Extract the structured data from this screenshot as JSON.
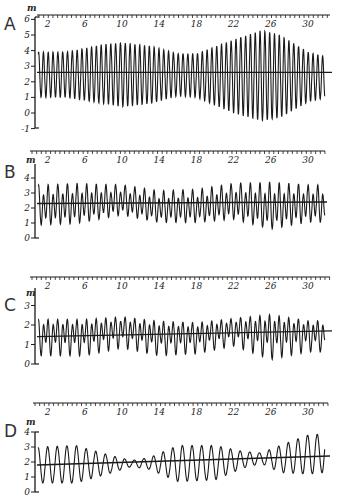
{
  "figure": {
    "unit": "m"
  },
  "chart_data": [
    {
      "type": "line",
      "panel": "A",
      "ylabel": "m",
      "ylim": [
        -1,
        6
      ],
      "yticks": [
        6,
        5,
        4,
        3,
        2,
        1,
        0,
        -1
      ],
      "xlim": [
        1,
        32
      ],
      "xticks": [
        2,
        6,
        10,
        14,
        18,
        22,
        26,
        30
      ],
      "grid": false,
      "mean_level": [
        2.6,
        2.6
      ],
      "tide_type": "semidiurnal",
      "envelope": [
        {
          "day": 1,
          "high": 3.9,
          "low": 1.0
        },
        {
          "day": 4,
          "high": 3.9,
          "low": 1.0
        },
        {
          "day": 8,
          "high": 4.4,
          "low": 0.6
        },
        {
          "day": 10,
          "high": 4.5,
          "low": 0.4
        },
        {
          "day": 13,
          "high": 4.3,
          "low": 0.6
        },
        {
          "day": 16,
          "high": 3.8,
          "low": 1.1
        },
        {
          "day": 18,
          "high": 3.8,
          "low": 1.0
        },
        {
          "day": 22,
          "high": 4.7,
          "low": 0.0
        },
        {
          "day": 25,
          "high": 5.3,
          "low": -0.5
        },
        {
          "day": 27,
          "high": 5.0,
          "low": -0.3
        },
        {
          "day": 30,
          "high": 3.9,
          "low": 0.7
        },
        {
          "day": 32,
          "high": 3.6,
          "low": 1.0
        }
      ]
    },
    {
      "type": "line",
      "panel": "B",
      "ylabel": "m",
      "ylim": [
        0,
        4
      ],
      "yticks": [
        4,
        3,
        2,
        1,
        0
      ],
      "xlim": [
        1,
        32
      ],
      "xticks": [
        2,
        6,
        10,
        14,
        18,
        22,
        26,
        30
      ],
      "grid": false,
      "mean_level": [
        2.3,
        2.4
      ],
      "tide_type": "mixed, mainly semidiurnal",
      "envelope": [
        {
          "day": 1,
          "high": 3.6,
          "low": 0.7
        },
        {
          "day": 5,
          "high": 3.7,
          "low": 0.8
        },
        {
          "day": 10,
          "high": 3.6,
          "low": 1.4
        },
        {
          "day": 14,
          "high": 3.2,
          "low": 0.9
        },
        {
          "day": 18,
          "high": 3.3,
          "low": 0.9
        },
        {
          "day": 22,
          "high": 3.7,
          "low": 1.1
        },
        {
          "day": 26,
          "high": 3.8,
          "low": 0.4
        },
        {
          "day": 30,
          "high": 3.6,
          "low": 0.9
        }
      ]
    },
    {
      "type": "line",
      "panel": "C",
      "ylabel": "m",
      "ylim": [
        0,
        3
      ],
      "yticks": [
        3,
        2,
        1,
        0
      ],
      "xlim": [
        1,
        32
      ],
      "xticks": [
        2,
        6,
        10,
        14,
        18,
        22,
        26,
        30
      ],
      "grid": false,
      "mean_level": [
        1.4,
        1.7
      ],
      "tide_type": "mixed",
      "envelope": [
        {
          "day": 1,
          "high": 2.5,
          "low": 0.4
        },
        {
          "day": 6,
          "high": 2.5,
          "low": 0.4
        },
        {
          "day": 10,
          "high": 2.6,
          "low": 0.8
        },
        {
          "day": 14,
          "high": 2.4,
          "low": 0.4
        },
        {
          "day": 18,
          "high": 2.3,
          "low": 0.5
        },
        {
          "day": 22,
          "high": 2.5,
          "low": 0.9
        },
        {
          "day": 26,
          "high": 2.8,
          "low": 0.2
        },
        {
          "day": 30,
          "high": 2.4,
          "low": 0.6
        }
      ]
    },
    {
      "type": "line",
      "panel": "D",
      "ylabel": "m",
      "ylim": [
        0,
        4
      ],
      "yticks": [
        4,
        3,
        2,
        1,
        0
      ],
      "xlim": [
        1,
        32
      ],
      "xticks": [
        2,
        6,
        10,
        14,
        18,
        22,
        26,
        30
      ],
      "grid": false,
      "mean_level": [
        1.8,
        2.4
      ],
      "tide_type": "diurnal",
      "envelope": [
        {
          "day": 1,
          "high": 3.0,
          "low": 0.6
        },
        {
          "day": 5,
          "high": 3.1,
          "low": 0.6
        },
        {
          "day": 9,
          "high": 2.4,
          "low": 1.3
        },
        {
          "day": 11,
          "high": 2.1,
          "low": 1.7
        },
        {
          "day": 13,
          "high": 2.3,
          "low": 1.5
        },
        {
          "day": 16,
          "high": 3.1,
          "low": 0.7
        },
        {
          "day": 20,
          "high": 3.1,
          "low": 0.8
        },
        {
          "day": 23,
          "high": 2.7,
          "low": 1.6
        },
        {
          "day": 25,
          "high": 2.6,
          "low": 1.9
        },
        {
          "day": 27,
          "high": 3.1,
          "low": 1.3
        },
        {
          "day": 30,
          "high": 3.8,
          "low": 1.2
        },
        {
          "day": 32,
          "high": 3.9,
          "low": 1.3
        }
      ]
    }
  ],
  "panels": [
    {
      "letter": "A",
      "unit": "m",
      "x_tick_labels": [
        "2",
        "6",
        "10",
        "14",
        "18",
        "22",
        "26",
        "30"
      ],
      "y_tick_labels": [
        "6",
        "5",
        "4",
        "3",
        "2",
        "1",
        "0",
        "-1"
      ]
    },
    {
      "letter": "B",
      "unit": "m",
      "x_tick_labels": [
        "2",
        "6",
        "10",
        "14",
        "18",
        "22",
        "26",
        "30"
      ],
      "y_tick_labels": [
        "4",
        "3",
        "2",
        "1",
        "0"
      ]
    },
    {
      "letter": "C",
      "unit": "m",
      "x_tick_labels": [
        "2",
        "6",
        "10",
        "14",
        "18",
        "22",
        "26",
        "30"
      ],
      "y_tick_labels": [
        "3",
        "2",
        "1",
        "0"
      ]
    },
    {
      "letter": "D",
      "unit": "m",
      "x_tick_labels": [
        "2",
        "6",
        "10",
        "14",
        "18",
        "22",
        "26",
        "30"
      ],
      "y_tick_labels": [
        "4",
        "3",
        "2",
        "1",
        "0"
      ]
    }
  ],
  "colors": {
    "ink": "#1a1a1a",
    "paper": "#ffffff"
  }
}
